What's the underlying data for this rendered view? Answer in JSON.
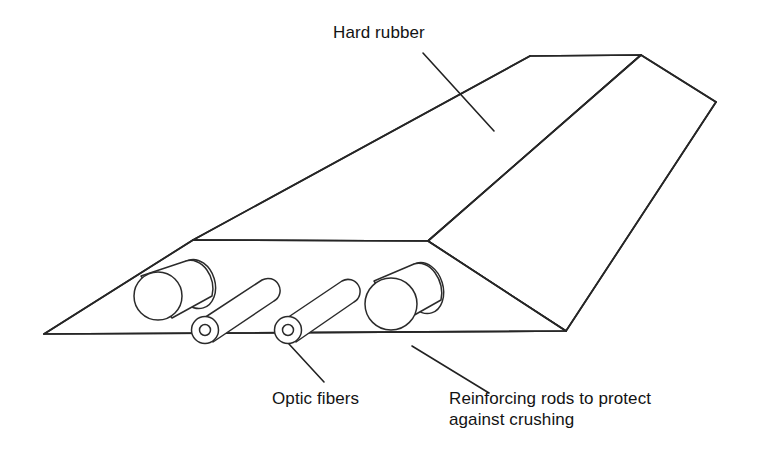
{
  "figure": {
    "background_color": "#ffffff",
    "line_color": "#262626",
    "text_color": "#131313",
    "width": 758,
    "height": 467
  },
  "labels": {
    "hard_rubber": "Hard rubber",
    "optic_fibers": "Optic fibers",
    "reinforcing_line1": "Reinforcing rods to protect",
    "reinforcing_line2": "against crushing"
  },
  "parts": {
    "hard_rubber_body": "hard-rubber-wedge",
    "large_rods": 2,
    "optic_fibers": 2
  }
}
